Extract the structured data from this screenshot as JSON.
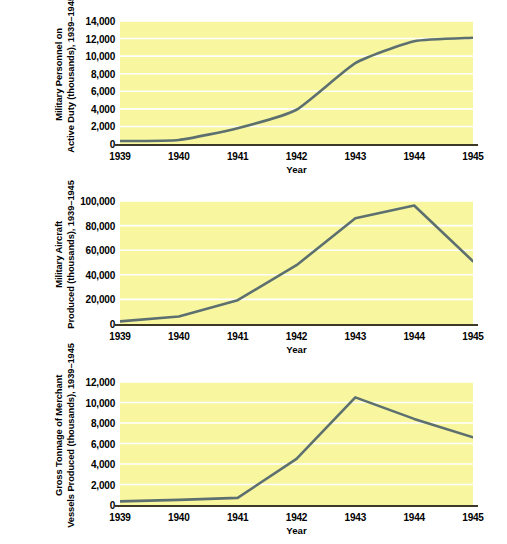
{
  "figure": {
    "background": "#ffffff",
    "plot_background": "#f9f6a0",
    "gridline_color": "#ffffff",
    "line_color": "#5d7070",
    "axis_color": "#3c3a26"
  },
  "chart_data": [
    {
      "type": "line",
      "title": "",
      "ylabel_line1": "Military Personnel on",
      "ylabel_line2": "Active Duty (thousands),",
      "ylabel_line3": "1939–1945",
      "xlabel": "Year",
      "categories": [
        "1939",
        "1940",
        "1941",
        "1942",
        "1943",
        "1944",
        "1945"
      ],
      "x": [
        1939,
        1940,
        1941,
        1942,
        1943,
        1944,
        1945
      ],
      "values": [
        335,
        458,
        1800,
        3900,
        9200,
        11700,
        12100
      ],
      "ylim": [
        0,
        14000
      ],
      "xlim": [
        1939,
        1945
      ],
      "yticks": [
        0,
        2000,
        4000,
        6000,
        8000,
        10000,
        12000,
        14000
      ],
      "ytick_labels": [
        "0",
        "2,000",
        "4,000",
        "6,000",
        "8,000",
        "10,000",
        "12,000",
        "14,000"
      ],
      "grid": true,
      "legend": "none"
    },
    {
      "type": "line",
      "title": "",
      "ylabel_line1": "Military Aircraft",
      "ylabel_line2": "Produced (thousands),",
      "ylabel_line3": "1939–1945",
      "xlabel": "Year",
      "categories": [
        "1939",
        "1940",
        "1941",
        "1942",
        "1943",
        "1944",
        "1945"
      ],
      "x": [
        1939,
        1940,
        1941,
        1942,
        1943,
        1944,
        1945
      ],
      "values": [
        2100,
        6100,
        19400,
        47800,
        85900,
        96300,
        51000
      ],
      "ylim": [
        0,
        100000
      ],
      "xlim": [
        1939,
        1945
      ],
      "yticks": [
        0,
        20000,
        40000,
        60000,
        80000,
        100000
      ],
      "ytick_labels": [
        "0",
        "20,000",
        "40,000",
        "60,000",
        "80,000",
        "100,000"
      ],
      "grid": true,
      "legend": "none"
    },
    {
      "type": "line",
      "title": "",
      "ylabel_line1": "Gross Tonnage of Merchant",
      "ylabel_line2": "Vessels Produced (thousands),",
      "ylabel_line3": "1939–1945",
      "xlabel": "Year",
      "categories": [
        "1939",
        "1940",
        "1941",
        "1942",
        "1943",
        "1944",
        "1945"
      ],
      "x": [
        1939,
        1940,
        1941,
        1942,
        1943,
        1944,
        1945
      ],
      "values": [
        350,
        500,
        700,
        4500,
        10500,
        8400,
        6600
      ],
      "ylim": [
        0,
        12000
      ],
      "xlim": [
        1939,
        1945
      ],
      "yticks": [
        0,
        2000,
        4000,
        6000,
        8000,
        10000,
        12000
      ],
      "ytick_labels": [
        "0",
        "2,000",
        "4,000",
        "6,000",
        "8,000",
        "10,000",
        "12,000"
      ],
      "grid": true,
      "legend": "none"
    }
  ]
}
